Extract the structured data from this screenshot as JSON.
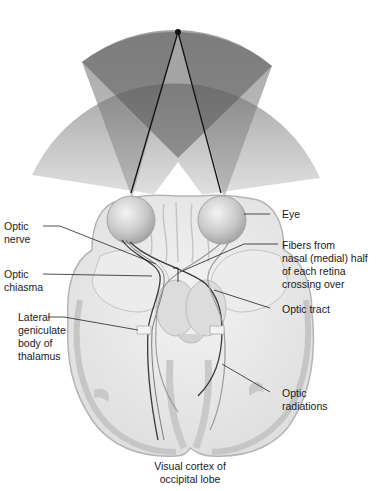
{
  "diagram": {
    "colors": {
      "field_dark": "#6e6e6e",
      "field_mid": "#a8a8a8",
      "field_light": "#d6d6d6",
      "brain_fill": "#e9e9e9",
      "brain_outline": "#b9b9b9",
      "cortex_band": "#c4c4c4",
      "nerve": "#3a3a3a",
      "leader": "#222222"
    },
    "labels": {
      "optic_nerve": [
        "Optic",
        "nerve"
      ],
      "optic_chiasma": [
        "Optic",
        "chiasma"
      ],
      "lateral_geniculate": [
        "Lateral",
        "geniculate",
        "body of",
        "thalamus"
      ],
      "eye": [
        "Eye"
      ],
      "fibers_crossing": [
        "Fibers from",
        "nasal (medial) half",
        "of each retina",
        "crossing over"
      ],
      "optic_tract": [
        "Optic tract"
      ],
      "optic_radiations": [
        "Optic",
        "radiations"
      ],
      "visual_cortex": [
        "Visual cortex of",
        "occipital lobe"
      ]
    }
  }
}
